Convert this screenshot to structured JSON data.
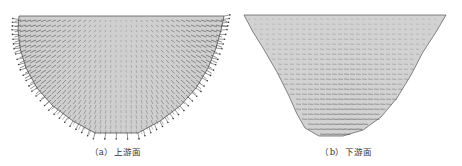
{
  "figures": [
    {
      "id": "a",
      "caption": "（a）上游面",
      "surface_fill": "#cfcfcf",
      "outline_color": "#555555",
      "arrow_color": "#3a3a3a",
      "outline": [
        [
          19,
          16
        ],
        [
          224,
          16
        ],
        [
          221,
          30
        ],
        [
          216,
          48
        ],
        [
          208,
          68
        ],
        [
          196,
          88
        ],
        [
          180,
          106
        ],
        [
          160,
          121
        ],
        [
          138,
          133
        ],
        [
          95,
          133
        ],
        [
          73,
          121
        ],
        [
          53,
          106
        ],
        [
          37,
          88
        ],
        [
          26,
          68
        ],
        [
          20,
          48
        ],
        [
          18,
          30
        ]
      ],
      "arrow_pattern": "radial-outward"
    },
    {
      "id": "b",
      "caption": "（b）下游面",
      "surface_fill": "#d2d2d2",
      "outline_color": "#666666",
      "arrow_color": "#444444",
      "outline": [
        [
          13,
          15
        ],
        [
          215,
          15
        ],
        [
          205,
          32
        ],
        [
          192,
          52
        ],
        [
          180,
          75
        ],
        [
          166,
          98
        ],
        [
          150,
          117
        ],
        [
          132,
          130
        ],
        [
          112,
          136
        ],
        [
          88,
          136
        ],
        [
          74,
          128
        ],
        [
          66,
          114
        ],
        [
          58,
          96
        ],
        [
          46,
          72
        ],
        [
          32,
          48
        ],
        [
          22,
          32
        ]
      ],
      "arrow_pattern": "horizontal"
    }
  ]
}
